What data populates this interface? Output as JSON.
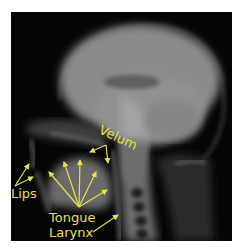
{
  "figure": {
    "annotation_color": "#e6e24a",
    "labels": {
      "velum": "Velum",
      "lips": "Lips",
      "tongue": "Tongue",
      "larynx": "Larynx"
    }
  }
}
